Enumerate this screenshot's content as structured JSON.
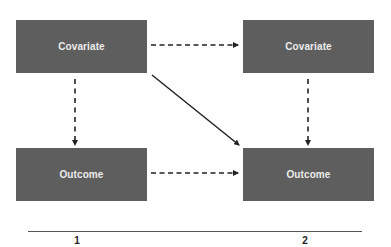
{
  "diagram": {
    "nodes": [
      {
        "id": "covariate-t1",
        "label": "Covariate",
        "wave": 1,
        "row": "top"
      },
      {
        "id": "covariate-t2",
        "label": "Covariate",
        "wave": 2,
        "row": "top"
      },
      {
        "id": "outcome-t1",
        "label": "Outcome",
        "wave": 1,
        "row": "bottom"
      },
      {
        "id": "outcome-t2",
        "label": "Outcome",
        "wave": 2,
        "row": "bottom"
      }
    ],
    "edges": [
      {
        "from": "covariate-t1",
        "to": "covariate-t2",
        "style": "dashed"
      },
      {
        "from": "covariate-t1",
        "to": "outcome-t1",
        "style": "dashed"
      },
      {
        "from": "covariate-t2",
        "to": "outcome-t2",
        "style": "dashed"
      },
      {
        "from": "outcome-t1",
        "to": "outcome-t2",
        "style": "dashed"
      },
      {
        "from": "covariate-t1",
        "to": "outcome-t2",
        "style": "solid"
      }
    ],
    "axis": {
      "labels": [
        "1",
        "2"
      ]
    },
    "colors": {
      "node_fill": "#5e5e5e",
      "node_text": "#ececec",
      "edge": "#222222"
    }
  }
}
